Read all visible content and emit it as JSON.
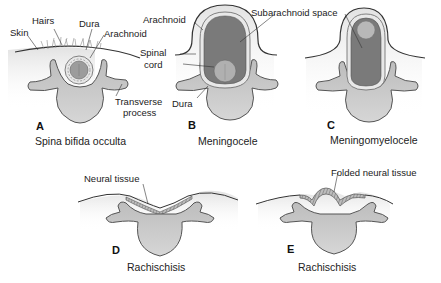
{
  "figure": {
    "panels": [
      {
        "id": "A",
        "caption": "Spina bifida occulta",
        "labels": {
          "skin": "Skin",
          "hairs": "Hairs",
          "dura": "Dura",
          "arachnoid": "Arachnoid",
          "transverse_process_line1": "Transverse",
          "transverse_process_line2": "process"
        }
      },
      {
        "id": "B",
        "caption": "Meningocele",
        "labels": {
          "arachnoid": "Arachnoid",
          "spinal_cord_line1": "Spinal",
          "spinal_cord_line2": "cord",
          "dura": "Dura"
        }
      },
      {
        "id": "C",
        "caption": "Meningomyelocele",
        "labels": {
          "subarachnoid_space": "Subarachnoid space"
        }
      },
      {
        "id": "D",
        "caption": "Rachischisis",
        "labels": {
          "neural_tissue": "Neural tissue"
        }
      },
      {
        "id": "E",
        "caption": "Rachischisis",
        "labels": {
          "folded_neural_tissue": "Folded neural tissue"
        }
      }
    ],
    "colors": {
      "bone": "#c9c9c9",
      "bone_outline": "#555555",
      "csf_sac": "#7a7a7a",
      "spinal_cord": "#a8a8a8",
      "tissue_shade": "#ececec",
      "neural_tissue": "#9a9a9a"
    }
  }
}
